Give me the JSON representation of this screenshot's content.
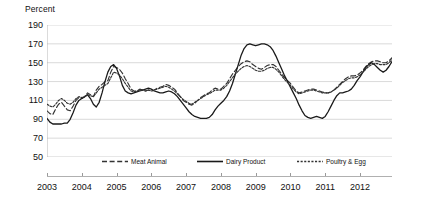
{
  "chart_data": {
    "type": "line",
    "title": "",
    "ylabel": "Percent",
    "xlabel": "",
    "ylim": [
      50,
      190
    ],
    "ytick_values": [
      190,
      170,
      150,
      130,
      110,
      90,
      70,
      50
    ],
    "xlim": [
      2003.0,
      2012.92
    ],
    "xtick_labels": [
      "2003",
      "2004",
      "2005",
      "2006",
      "2007",
      "2008",
      "2009",
      "2010",
      "2011",
      "2012"
    ],
    "xtick_values": [
      2003,
      2004,
      2005,
      2006,
      2007,
      2008,
      2009,
      2010,
      2011,
      2012
    ],
    "grid": true,
    "legend_position": "bottom",
    "x_start": 2003.0,
    "x_step": 0.08333,
    "series": [
      {
        "name": "Meat Animal",
        "style": "dashed",
        "color": "#333333",
        "values": [
          99,
          96,
          95,
          101,
          106,
          108,
          104,
          100,
          99,
          104,
          110,
          113,
          112,
          114,
          118,
          116,
          114,
          121,
          125,
          127,
          130,
          131,
          140,
          146,
          145,
          143,
          139,
          133,
          128,
          122,
          120,
          120,
          122,
          121,
          120,
          121,
          120,
          121,
          123,
          124,
          125,
          127,
          126,
          124,
          122,
          118,
          114,
          110,
          108,
          106,
          105,
          107,
          110,
          113,
          115,
          117,
          118,
          121,
          123,
          122,
          122,
          125,
          128,
          133,
          138,
          142,
          146,
          149,
          151,
          152,
          151,
          148,
          146,
          144,
          143,
          145,
          147,
          148,
          148,
          146,
          142,
          138,
          134,
          131,
          128,
          124,
          120,
          118,
          119,
          120,
          121,
          122,
          122,
          121,
          120,
          119,
          118,
          118,
          119,
          121,
          124,
          127,
          130,
          133,
          135,
          136,
          136,
          137,
          139,
          142,
          146,
          149,
          151,
          152,
          152,
          151,
          150,
          150,
          152,
          155,
          158,
          160,
          162,
          164,
          166,
          168,
          167,
          165,
          163,
          162,
          164,
          166,
          167,
          168,
          170,
          171,
          170,
          168,
          166,
          165,
          166,
          168,
          169,
          170
        ]
      },
      {
        "name": "Dairy Product",
        "style": "solid",
        "color": "#1a1a1a",
        "values": [
          91,
          87,
          85,
          85,
          85,
          85,
          86,
          86,
          90,
          97,
          105,
          110,
          112,
          114,
          116,
          112,
          106,
          103,
          108,
          118,
          130,
          140,
          146,
          148,
          144,
          136,
          126,
          120,
          118,
          117,
          118,
          119,
          120,
          121,
          122,
          123,
          122,
          120,
          119,
          118,
          118,
          119,
          120,
          119,
          117,
          114,
          110,
          106,
          102,
          98,
          95,
          93,
          92,
          91,
          91,
          91,
          92,
          95,
          100,
          104,
          107,
          110,
          114,
          120,
          128,
          138,
          148,
          158,
          165,
          169,
          170,
          169,
          168,
          169,
          170,
          170,
          169,
          167,
          163,
          157,
          150,
          143,
          136,
          130,
          124,
          118,
          112,
          105,
          99,
          94,
          92,
          91,
          92,
          93,
          92,
          91,
          93,
          98,
          104,
          110,
          115,
          118,
          118,
          119,
          120,
          122,
          126,
          131,
          135,
          140,
          145,
          148,
          150,
          148,
          145,
          142,
          140,
          142,
          146,
          151,
          156,
          160,
          163,
          166,
          168,
          166,
          163,
          160,
          156,
          152,
          150,
          152,
          155,
          152,
          146,
          140,
          134,
          130,
          128,
          128,
          130,
          134,
          140,
          146
        ]
      },
      {
        "name": "Poultry & Egg",
        "style": "dotted",
        "color": "#333333",
        "values": [
          106,
          104,
          103,
          106,
          110,
          112,
          110,
          107,
          106,
          108,
          112,
          114,
          113,
          114,
          116,
          115,
          114,
          118,
          122,
          124,
          126,
          128,
          134,
          140,
          139,
          137,
          133,
          128,
          124,
          120,
          119,
          120,
          121,
          121,
          120,
          121,
          120,
          121,
          122,
          123,
          124,
          125,
          124,
          122,
          120,
          117,
          114,
          111,
          109,
          107,
          106,
          108,
          110,
          112,
          114,
          116,
          117,
          119,
          121,
          121,
          121,
          123,
          126,
          130,
          134,
          138,
          141,
          144,
          146,
          147,
          146,
          144,
          142,
          141,
          141,
          142,
          144,
          145,
          145,
          143,
          140,
          136,
          132,
          129,
          126,
          122,
          119,
          117,
          118,
          119,
          120,
          121,
          121,
          120,
          119,
          118,
          118,
          118,
          119,
          121,
          123,
          126,
          129,
          131,
          133,
          134,
          134,
          135,
          137,
          140,
          143,
          146,
          148,
          149,
          149,
          148,
          148,
          148,
          150,
          153,
          156,
          158,
          160,
          162,
          164,
          166,
          165,
          163,
          162,
          161,
          162,
          164,
          165,
          166,
          168,
          169,
          168,
          166,
          165,
          164,
          164,
          166,
          167,
          168
        ]
      }
    ]
  }
}
